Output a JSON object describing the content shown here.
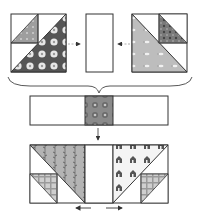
{
  "diagram": {
    "colors": {
      "outline": "#333333",
      "background": "#ffffff",
      "dark_floral": "#555555",
      "light_gray_print": "#bdbdbd",
      "mid_gray_print": "#8a8a8a",
      "vine_print": "#b0b0b0",
      "house_print": "#f2f2f2",
      "plaid_print": "#c4c4c4",
      "arrow": "#333333"
    },
    "step1": {
      "left_unit": "HST unit with small HST in top-left corner and dark floral large triangle",
      "center_piece": "Plain white rectangle",
      "right_unit": "HST unit with small HST in top-right corner and light gray print large triangle"
    },
    "step2": {
      "strip": "Row strip with patterned center square"
    },
    "step3": {
      "result": "Assembled row with vine print and house print triangles",
      "press_arrows": [
        "left",
        "right"
      ]
    }
  }
}
